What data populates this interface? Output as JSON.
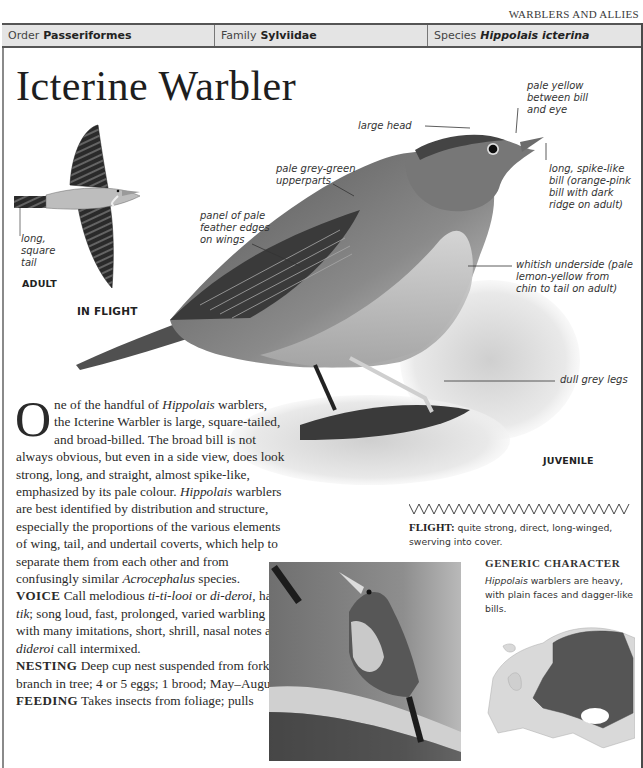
{
  "running_head": "WARBLERS AND ALLIES",
  "taxonomy": {
    "order": {
      "key": "Order",
      "value": "Passeriformes"
    },
    "family": {
      "key": "Family",
      "value": "Sylviidae"
    },
    "species": {
      "key": "Species",
      "value": "Hippolais icterina"
    }
  },
  "title": "Icterine Warbler",
  "in_flight": {
    "label_tail": [
      "long,",
      "square",
      "tail"
    ],
    "age_label": "ADULT",
    "caption": "IN FLIGHT"
  },
  "main_illustration": {
    "age_label": "JUVENILE",
    "annotations": {
      "pale_yellow": [
        "pale yellow",
        "between bill",
        "and eye"
      ],
      "large_head": "large head",
      "upperparts": [
        "pale grey-green",
        "upperparts"
      ],
      "bill": [
        "long, spike-like",
        "bill (orange-pink",
        "bill with dark",
        "ridge on adult)"
      ],
      "wing_panel": [
        "panel of pale",
        "feather edges",
        "on wings"
      ],
      "underside": [
        "whitish underside (pale",
        "lemon-yellow from",
        "chin to tail on adult)"
      ],
      "legs": "dull grey legs"
    }
  },
  "body": {
    "dropcap": "O",
    "intro_1": "ne of the handful of ",
    "intro_genus": "Hippolais",
    "intro_2": " warblers, the Icterine Warbler is large, square-tailed, and broad-billed. The broad bill is not always obvious, but even in a side view, does look strong, long, and straight, almost spike-like, emphasized by its pale colour. ",
    "intro_genus2": "Hippolais",
    "intro_3": " warblers are best identified by distribution and structure, especially the proportions of the various elements of wing, tail, and undertail coverts, which help to separate them from each other and from confusingly similar ",
    "intro_genus3": "Acrocephalus",
    "intro_4": " species.",
    "voice_head": "VOICE",
    "voice_1": " Call melodious ",
    "voice_call1": "ti-ti-looi",
    "voice_2": " or ",
    "voice_call2": "di-deroi",
    "voice_3": ", hard ",
    "voice_call3": "tik",
    "voice_4": "; song loud, fast, prolonged, varied warbling with many imitations, short, shrill, nasal notes and ",
    "voice_call4": "dideroi",
    "voice_5": " call intermixed.",
    "nesting_head": "NESTING",
    "nesting": " Deep cup nest suspended from forked branch in tree; 4 or 5 eggs; 1 brood; May–August.",
    "feeding_head": "FEEDING",
    "feeding": " Takes insects from foliage; pulls"
  },
  "flight": {
    "head": "FLIGHT:",
    "text": " quite strong, direct, long-winged, swerving into cover."
  },
  "generic": {
    "head": "GENERIC CHARACTER",
    "genus": "Hippolais",
    "text": " warblers are heavy, with plain faces and dagger-like bills."
  },
  "colors": {
    "taxonomy_bar": "#e4e4e4",
    "frame": "#555555",
    "text": "#231f20"
  }
}
